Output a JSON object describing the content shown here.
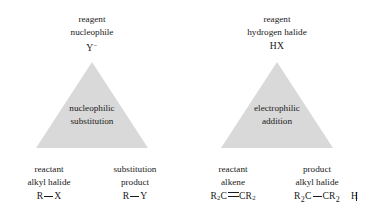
{
  "figure": {
    "triangle_fill_color": "#d9d9d9",
    "text_color": "#1a1a1a",
    "background_color": "#ffffff"
  },
  "panels": [
    {
      "id": "nucleophilic-substitution",
      "top_label": {
        "line1": "reagent",
        "line2": "nucleophile",
        "formula_base": "Y",
        "formula_charge": "−"
      },
      "inside_label": {
        "line1": "nucleophilic",
        "line2": "substitution"
      },
      "bottom_left": {
        "line1": "reactant",
        "line2": "alkyl halide",
        "formula_left": "R",
        "formula_right": "X"
      },
      "bottom_right": {
        "line1": "substitution",
        "line2": "product",
        "formula_left": "R",
        "formula_right": "Y"
      }
    },
    {
      "id": "electrophilic-addition",
      "top_label": {
        "line1": "reagent",
        "line2": "hydrogen halide",
        "formula": "HX"
      },
      "inside_label": {
        "line1": "electrophilic",
        "line2": "addition"
      },
      "bottom_left": {
        "line1": "reactant",
        "line2": "alkene",
        "formula_left_atom": "R",
        "formula_left_sub": "2",
        "formula_left_c": "C",
        "formula_right_c": "CR",
        "formula_right_sub": "2"
      },
      "bottom_right": {
        "line1": "product",
        "line2": "alkyl halide",
        "struct_left_r": "R",
        "struct_left_sub": "2",
        "struct_left_c": "C",
        "struct_right_c": "CR",
        "struct_right_sub": "2",
        "substituent_1": "H",
        "substituent_2": "X"
      }
    }
  ]
}
